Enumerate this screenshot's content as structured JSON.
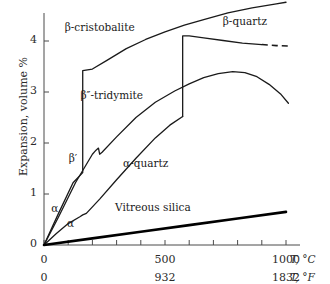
{
  "chart_data": {
    "type": "line",
    "title": "",
    "xlabel": "T, °C",
    "ylabel": "Expansion, volume  %",
    "xlim": [
      0,
      1070
    ],
    "ylim": [
      0,
      4.85
    ],
    "grid": false,
    "legend": "inline-labels",
    "x_axis_primary": {
      "unit": "T, °C",
      "ticks": [
        0,
        100,
        200,
        300,
        400,
        500,
        600,
        700,
        800,
        900,
        1000
      ],
      "labeled_ticks": [
        {
          "value": 0,
          "label": "0"
        },
        {
          "value": 500,
          "label": "500"
        },
        {
          "value": 1000,
          "label": "1000"
        }
      ]
    },
    "x_axis_secondary": {
      "unit": "T, °F",
      "labeled_ticks": [
        {
          "value": 0,
          "label": "0"
        },
        {
          "value": 500,
          "label": "932"
        },
        {
          "value": 1000,
          "label": "1832"
        }
      ]
    },
    "y_axis": {
      "unit": "%",
      "ticks": [
        0,
        1,
        2,
        3,
        4
      ],
      "labeled_ticks": [
        {
          "value": 0,
          "label": "0"
        },
        {
          "value": 1,
          "label": "1"
        },
        {
          "value": 2,
          "label": "2"
        },
        {
          "value": 3,
          "label": "3"
        },
        {
          "value": 4,
          "label": "4"
        }
      ]
    },
    "series": [
      {
        "name": "β-cristobalite",
        "label": "β-cristobalite",
        "style": "solid",
        "points": [
          [
            0,
            0
          ],
          [
            60,
            0.62
          ],
          [
            120,
            1.22
          ],
          [
            160,
            1.42
          ],
          [
            160,
            3.42
          ],
          [
            200,
            3.45
          ],
          [
            260,
            3.62
          ],
          [
            340,
            3.85
          ],
          [
            420,
            4.03
          ],
          [
            500,
            4.18
          ],
          [
            580,
            4.31
          ],
          [
            660,
            4.42
          ],
          [
            760,
            4.55
          ],
          [
            860,
            4.65
          ],
          [
            960,
            4.73
          ],
          [
            1000,
            4.76
          ]
        ]
      },
      {
        "name": "β''-tridymite",
        "label": "β″-tridymite",
        "style": "solid",
        "points": [
          [
            0,
            0
          ],
          [
            60,
            0.55
          ],
          [
            130,
            1.22
          ],
          [
            200,
            1.78
          ],
          [
            215,
            1.86
          ],
          [
            225,
            1.9
          ],
          [
            230,
            1.78
          ],
          [
            240,
            1.82
          ],
          [
            300,
            2.12
          ],
          [
            380,
            2.5
          ],
          [
            460,
            2.8
          ],
          [
            540,
            3.02
          ],
          [
            600,
            3.16
          ],
          [
            660,
            3.28
          ],
          [
            720,
            3.36
          ],
          [
            780,
            3.4
          ],
          [
            830,
            3.38
          ],
          [
            880,
            3.3
          ],
          [
            930,
            3.15
          ],
          [
            980,
            2.95
          ],
          [
            1010,
            2.78
          ]
        ]
      },
      {
        "name": "β-quartz",
        "label": "β-quartz",
        "style": "solid-with-dashed-extension",
        "points": [
          [
            573,
            2.52
          ],
          [
            573,
            4.1
          ],
          [
            600,
            4.1
          ],
          [
            660,
            4.06
          ],
          [
            740,
            4.01
          ],
          [
            820,
            3.96
          ],
          [
            900,
            3.93
          ]
        ],
        "dashed_points": [
          [
            900,
            3.93
          ],
          [
            960,
            3.91
          ],
          [
            1020,
            3.9
          ]
        ]
      },
      {
        "name": "α-quartz",
        "label": "α-quartz",
        "style": "solid",
        "points": [
          [
            0,
            0
          ],
          [
            50,
            0.22
          ],
          [
            100,
            0.42
          ],
          [
            150,
            0.56
          ],
          [
            160,
            0.59
          ],
          [
            165,
            0.6
          ],
          [
            175,
            0.62
          ],
          [
            230,
            0.9
          ],
          [
            300,
            1.28
          ],
          [
            380,
            1.7
          ],
          [
            460,
            2.1
          ],
          [
            520,
            2.35
          ],
          [
            573,
            2.52
          ]
        ]
      },
      {
        "name": "Vitreous silica",
        "label": "Vitreous silica",
        "style": "thick-solid",
        "points": [
          [
            0,
            0
          ],
          [
            200,
            0.13
          ],
          [
            400,
            0.26
          ],
          [
            600,
            0.39
          ],
          [
            800,
            0.52
          ],
          [
            1000,
            0.65
          ]
        ]
      }
    ],
    "annotations": [
      {
        "text": "β-cristobalite",
        "x": 230,
        "y": 4.25
      },
      {
        "text": "β-quartz",
        "x": 830,
        "y": 4.38
      },
      {
        "text": "β″-tridymite",
        "x": 280,
        "y": 2.92
      },
      {
        "text": "β′",
        "x": 120,
        "y": 1.68
      },
      {
        "text": "α-quartz",
        "x": 420,
        "y": 1.58
      },
      {
        "text": "α",
        "x": 45,
        "y": 0.7
      },
      {
        "text": "α",
        "x": 110,
        "y": 0.42
      },
      {
        "text": "Vitreous silica",
        "x": 450,
        "y": 0.72
      }
    ]
  }
}
